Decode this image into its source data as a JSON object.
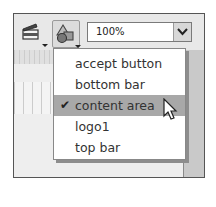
{
  "toolbar": {
    "clapper_button": {
      "icon": "clapperboard-icon"
    },
    "shapes_button": {
      "icon": "shapes-icon"
    },
    "zoom": {
      "value": "100%"
    }
  },
  "menu": {
    "items": [
      {
        "label": "accept button",
        "checked": false
      },
      {
        "label": "bottom bar",
        "checked": false
      },
      {
        "label": "content area",
        "checked": true
      },
      {
        "label": "logo1",
        "checked": false
      },
      {
        "label": "top bar",
        "checked": false
      }
    ],
    "check_glyph": "✔"
  },
  "colors": {
    "selected_bg": "#a8a8a8",
    "panel_bg": "#e6e6e6"
  }
}
